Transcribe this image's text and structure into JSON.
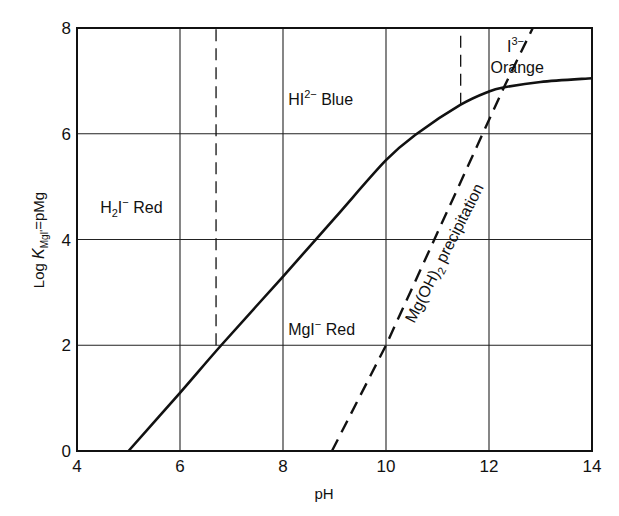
{
  "chart_data": {
    "type": "line",
    "title": "",
    "xlabel": "pH",
    "ylabel": "Log K_MgI' = pMg",
    "ylabel_parts": {
      "prefix": "Log ",
      "K": "K",
      "sub": "MgI'",
      "suffix": "=pMg"
    },
    "xlim": [
      4,
      14
    ],
    "ylim": [
      0,
      8
    ],
    "x_ticks": [
      4,
      6,
      8,
      10,
      12,
      14
    ],
    "y_ticks": [
      0,
      2,
      4,
      6,
      8
    ],
    "grid": true,
    "legend": null,
    "series": [
      {
        "name": "log K_MgI' (conditional formation constant)",
        "style": "solid",
        "x": [
          5.0,
          6.0,
          6.8,
          8.0,
          9.0,
          10.0,
          10.6,
          11.45,
          12.0,
          12.3,
          13.0,
          14.0
        ],
        "y": [
          0.0,
          1.1,
          2.0,
          3.3,
          4.4,
          5.5,
          6.0,
          6.55,
          6.8,
          6.88,
          6.98,
          7.05
        ]
      },
      {
        "name": "Mg(OH)2 precipitation",
        "style": "dashed",
        "x": [
          8.95,
          10.0,
          12.3,
          12.85
        ],
        "y": [
          0.0,
          2.0,
          6.9,
          8.0
        ]
      },
      {
        "name": "H2I-/HI2- transition",
        "style": "dashed",
        "x": [
          6.7,
          6.7
        ],
        "y": [
          2.0,
          8.0
        ]
      },
      {
        "name": "HI2-/I3- transition",
        "style": "dashed",
        "x": [
          11.45,
          11.45
        ],
        "y": [
          6.55,
          8.0
        ]
      }
    ],
    "annotations": [
      {
        "id": "h2i",
        "text": "H2I⁻ Red",
        "main": "H",
        "sub": "2",
        "mid": "I",
        "sup": "−",
        "tail": " Red",
        "x": 4.45,
        "y": 4.5
      },
      {
        "id": "hi2",
        "text": "HI2− Blue",
        "main": "HI",
        "sup": "2−",
        "tail": " Blue",
        "x": 8.1,
        "y": 6.55
      },
      {
        "id": "mgi",
        "text": "MgI− Red",
        "main": "MgI",
        "sup": "−",
        "tail": " Red",
        "x": 8.1,
        "y": 2.2
      },
      {
        "id": "i3",
        "text": "I3− Orange",
        "main": "I",
        "sup": "3−",
        "line2": "Orange",
        "x": 12.95,
        "y": 7.55
      },
      {
        "id": "mgoh",
        "text": "Mg(OH)2 precipitation",
        "main": "Mg(OH)",
        "sub": "2",
        "tail": " precipitation",
        "x": 10.55,
        "y": 2.4,
        "angle": -63
      }
    ]
  }
}
